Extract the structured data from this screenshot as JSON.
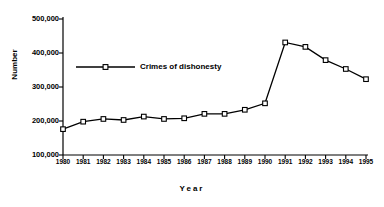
{
  "chart_data": {
    "type": "line",
    "title": "",
    "xlabel": "Year",
    "ylabel": "Number",
    "categories": [
      "1980",
      "1981",
      "1982",
      "1983",
      "1984",
      "1985",
      "1986",
      "1987",
      "1988",
      "1989",
      "1990",
      "1991",
      "1992",
      "1993",
      "1994",
      "1995"
    ],
    "series": [
      {
        "name": "Crimes of dishonesty",
        "values": [
          176000,
          198000,
          206000,
          203000,
          213000,
          206000,
          208000,
          221000,
          221000,
          233000,
          252000,
          431000,
          418000,
          379000,
          353000,
          323000
        ]
      }
    ],
    "ylim": [
      100000,
      500000
    ],
    "ytick_values": [
      100000,
      200000,
      300000,
      400000,
      500000
    ],
    "ytick_labels": [
      "100,000",
      "200,000",
      "300,000",
      "400,000",
      "500,000"
    ],
    "grid": false,
    "legend_position": "inside-upper-left",
    "marker": "open-square",
    "line_color": "#000000",
    "marker_fill": "#ffffff"
  },
  "legend": {
    "entries": [
      {
        "label": "Crimes of dishonesty"
      }
    ]
  },
  "axes": {
    "x_title": "Year",
    "y_title": "Number"
  }
}
